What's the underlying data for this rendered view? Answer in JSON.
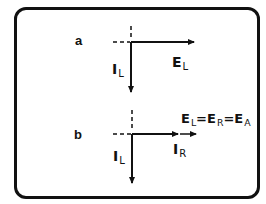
{
  "figure": {
    "panels": [
      {
        "id": "a",
        "label": "a",
        "vectors": [
          {
            "name": "E",
            "subscript": "L",
            "direction": "right"
          },
          {
            "name": "I",
            "subscript": "L",
            "direction": "down"
          }
        ]
      },
      {
        "id": "b",
        "label": "b",
        "vectors": [
          {
            "name": "I",
            "subscript": "R",
            "direction": "right"
          },
          {
            "name": "I",
            "subscript": "L",
            "direction": "down"
          }
        ],
        "equation": {
          "terms": [
            {
              "name": "E",
              "subscript": "L"
            },
            {
              "name": "E",
              "subscript": "R"
            },
            {
              "name": "E",
              "subscript": "A"
            }
          ],
          "operator": "="
        }
      }
    ]
  },
  "colors": {
    "ink": "#111111",
    "background": "#ffffff"
  }
}
